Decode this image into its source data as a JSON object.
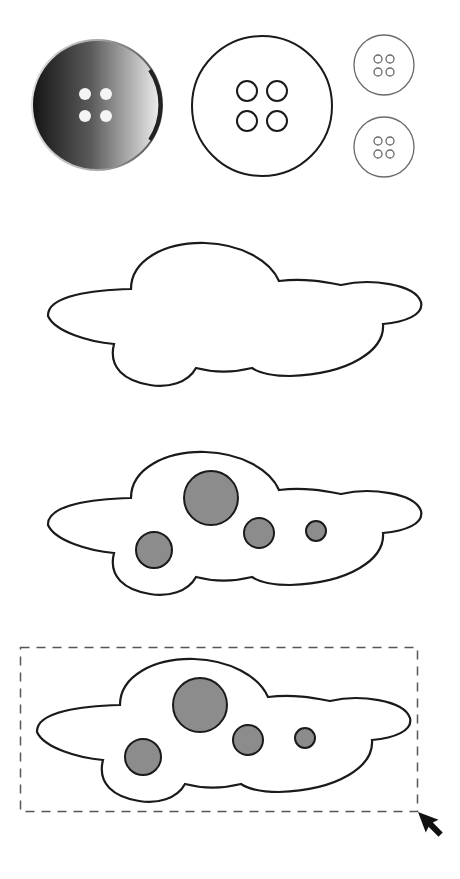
{
  "figure": {
    "colors": {
      "background": "#ffffff",
      "stroke": "#1a1a1a",
      "spot_fill": "#8c8c8c",
      "button_dark": "#1e1e1e",
      "button_light": "#e6e6e6",
      "small_button_stroke": "#6a6a6a",
      "selection_stroke": "#555555"
    },
    "buttons": [
      {
        "name": "shaded-button",
        "style": "gradient",
        "holes": 4
      },
      {
        "name": "outline-button-large",
        "style": "outline",
        "holes": 4
      },
      {
        "name": "outline-button-small-top",
        "style": "outline",
        "holes": 4
      },
      {
        "name": "outline-button-small-bottom",
        "style": "outline",
        "holes": 4
      }
    ],
    "clouds": [
      {
        "name": "plain-cloud",
        "spots": 0
      },
      {
        "name": "spotted-cloud",
        "spots": 4
      },
      {
        "name": "selected-spotted-cloud",
        "spots": 4,
        "selected": true
      }
    ],
    "selection": {
      "style": "dashed-rectangle"
    },
    "cursor": {
      "icon": "arrow-cursor-icon"
    }
  }
}
